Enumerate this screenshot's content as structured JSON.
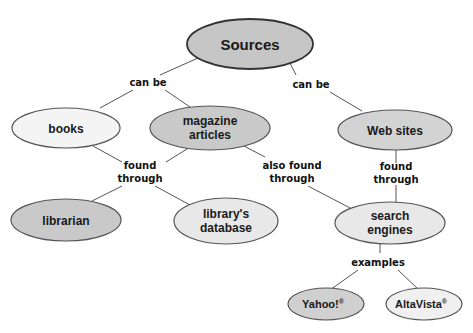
{
  "diagram": {
    "type": "concept-map",
    "colors": {
      "dark_fill": "#c9c9c9",
      "mid_fill": "#d3d3d3",
      "light_fill": "#ebebeb",
      "very_light_fill": "#f4f4f4",
      "stroke": "#444444",
      "line": "#555555"
    },
    "nodes": {
      "sources": "Sources",
      "books": "books",
      "magazine_l1": "magazine",
      "magazine_l2": "articles",
      "web_sites": "Web sites",
      "librarian": "librarian",
      "database_l1": "library's",
      "database_l2": "database",
      "search_l1": "search",
      "search_l2": "engines",
      "yahoo": "Yahoo!",
      "yahoo_mark": "®",
      "altavista": "AltaVista",
      "altavista_mark": "®"
    },
    "links": {
      "can_be_left": "can be",
      "can_be_right": "can be",
      "found_through_left_l1": "found",
      "found_through_left_l2": "through",
      "also_found_l1": "also found",
      "also_found_l2": "through",
      "found_through_right_l1": "found",
      "found_through_right_l2": "through",
      "examples": "examples"
    }
  }
}
